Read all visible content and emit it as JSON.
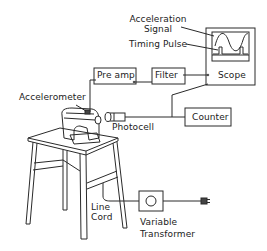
{
  "diagram": {
    "type": "experimental setup schematic",
    "labels": {
      "acceleration_signal_line1": "Acceleration",
      "acceleration_signal_line2": "Signal",
      "timing_pulse": "Timing Pulse",
      "pre_amp": "Pre amp",
      "filter": "Filter",
      "scope": "Scope",
      "accelerometer": "Accelerometer",
      "photocell": "Photocell",
      "counter": "Counter",
      "line_cord_line1": "Line",
      "line_cord_line2": "Cord",
      "variable_transformer_line1": "Variable",
      "variable_transformer_line2": "Transformer"
    },
    "components": [
      {
        "id": "accelerometer",
        "label": "Accelerometer"
      },
      {
        "id": "pre-amp",
        "label": "Pre amp"
      },
      {
        "id": "filter",
        "label": "Filter"
      },
      {
        "id": "scope",
        "label": "Scope",
        "traces": [
          "Acceleration Signal",
          "Timing Pulse"
        ]
      },
      {
        "id": "photocell",
        "label": "Photocell"
      },
      {
        "id": "counter",
        "label": "Counter"
      },
      {
        "id": "variable-transformer",
        "label": "Variable Transformer"
      },
      {
        "id": "line-cord",
        "label": "Line Cord"
      }
    ],
    "connections": [
      [
        "accelerometer",
        "pre-amp"
      ],
      [
        "pre-amp",
        "filter"
      ],
      [
        "filter",
        "scope"
      ],
      [
        "photocell",
        "counter"
      ],
      [
        "photocell",
        "scope"
      ],
      [
        "line-cord",
        "variable-transformer"
      ],
      [
        "variable-transformer",
        "power-plug"
      ]
    ],
    "colors": {
      "ink": "#2a2a2a",
      "background": "#ffffff"
    }
  }
}
